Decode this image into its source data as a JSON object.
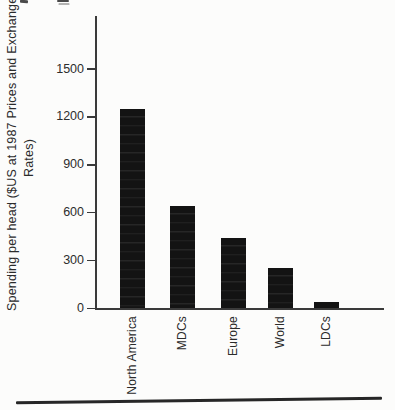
{
  "figure": {
    "ylabel_line1": "Spending per head ($US at 1987 Prices and Exchange",
    "ylabel_line2": "Rates)"
  },
  "chart_data": {
    "type": "bar",
    "title": "",
    "xlabel": "",
    "ylabel": "Spending per head ($US at 1987 Prices and Exchange Rates)",
    "categories": [
      "North America",
      "MDCs",
      "Europe",
      "World",
      "LDCs"
    ],
    "values": [
      1250,
      640,
      440,
      255,
      40
    ],
    "yticks": [
      0,
      300,
      600,
      900,
      1200,
      1500
    ],
    "ylim": [
      0,
      1800
    ],
    "bar_color": "#131313",
    "grid": false,
    "legend": null,
    "orientation": "vertical",
    "x_tick_label_rotation_deg": 90
  }
}
